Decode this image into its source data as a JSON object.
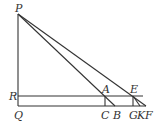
{
  "diagram": {
    "type": "geometry",
    "points": {
      "P": {
        "label": "P",
        "x": 18,
        "y": 14
      },
      "R": {
        "label": "R",
        "x": 18,
        "y": 96
      },
      "Q": {
        "label": "Q",
        "x": 18,
        "y": 106
      },
      "A": {
        "label": "A",
        "x": 105,
        "y": 96
      },
      "C": {
        "label": "C",
        "x": 105,
        "y": 106
      },
      "B": {
        "label": "B",
        "x": 115,
        "y": 106
      },
      "E": {
        "label": "E",
        "x": 133,
        "y": 96
      },
      "G": {
        "label": "G",
        "x": 133,
        "y": 106
      },
      "K": {
        "label": "K",
        "x": 140,
        "y": 106
      },
      "F": {
        "label": "F",
        "x": 146,
        "y": 106
      }
    },
    "segments": [
      "PQ",
      "QF",
      "RE",
      "PB",
      "PF",
      "AC",
      "EG",
      "EK"
    ],
    "line_color": "#333333"
  }
}
